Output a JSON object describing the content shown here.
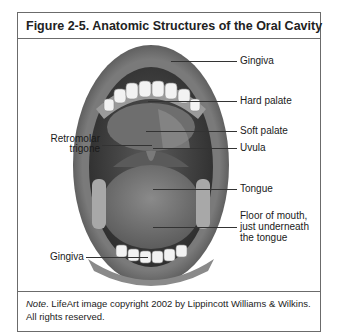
{
  "figure": {
    "title": "Figure 2-5. Anatomic Structures of the Oral Cavity",
    "labels_right": {
      "gingiva_upper": "Gingiva",
      "hard_palate": "Hard palate",
      "soft_palate": "Soft palate",
      "uvula": "Uvula",
      "tongue": "Tongue",
      "floor_line1": "Floor of mouth,",
      "floor_line2": "just underneath",
      "floor_line3": "the tongue"
    },
    "labels_left": {
      "retromolar_line1": "Retromolar",
      "retromolar_line2": "trigone",
      "gingiva_lower": "Gingiva"
    },
    "image_description": "Illustration of open mouth showing teeth, palate, uvula and tongue",
    "note_label": "Note",
    "note_text": ". LifeArt image copyright 2002 by Lippincott Williams & Wilkins. All rights reserved."
  }
}
